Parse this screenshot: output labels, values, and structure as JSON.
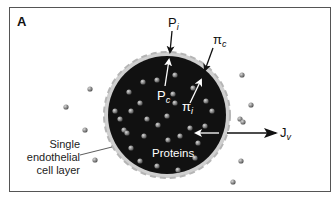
{
  "figure": {
    "panel_letter": "A",
    "labels": {
      "P_i": {
        "base": "P",
        "sub": "i"
      },
      "pi_c": {
        "base": "π",
        "sub": "c"
      },
      "P_c": {
        "base": "P",
        "sub": "c"
      },
      "pi_i": {
        "base": "π",
        "sub": "i"
      },
      "J_v": {
        "base": "J",
        "sub": "v"
      },
      "proteins": "Proteins",
      "endothelial": [
        "Single",
        "endothelial",
        "cell layer"
      ]
    },
    "colors": {
      "lumen": "#111111",
      "membrane": "#c8c8c8",
      "particle": "#8a8a8a",
      "arrow_dark": "#111111",
      "arrow_light": "#ffffff"
    }
  }
}
